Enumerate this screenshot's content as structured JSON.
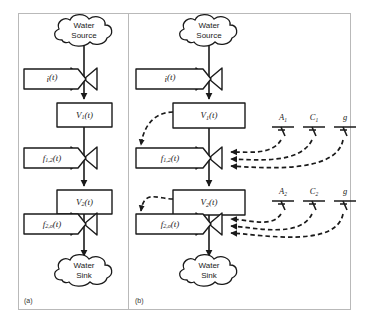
{
  "figure": {
    "panels": [
      {
        "id": "a",
        "label": "(a)",
        "source_cloud": {
          "line1": "Water",
          "line2": "Source"
        },
        "sink_cloud": {
          "line1": "Water",
          "line2": "Sink"
        },
        "flow_inflow": {
          "base": "i",
          "sub": "",
          "arg": "(t)"
        },
        "stock_1": {
          "base": "V",
          "sub": "1",
          "arg": "(t)"
        },
        "flow_mid": {
          "base": "f",
          "sub": "1,2",
          "arg": "(t)"
        },
        "stock_2": {
          "base": "V",
          "sub": "2",
          "arg": "(t)"
        },
        "flow_out": {
          "base": "f",
          "sub": "2,o",
          "arg": "(t)"
        },
        "parameters": []
      },
      {
        "id": "b",
        "label": "(b)",
        "source_cloud": {
          "line1": "Water",
          "line2": "Source"
        },
        "sink_cloud": {
          "line1": "Water",
          "line2": "Sink"
        },
        "flow_inflow": {
          "base": "i",
          "sub": "",
          "arg": "(t)"
        },
        "stock_1": {
          "base": "V",
          "sub": "1",
          "arg": "(t)"
        },
        "flow_mid": {
          "base": "f",
          "sub": "1,2",
          "arg": "(t)"
        },
        "stock_2": {
          "base": "V",
          "sub": "2",
          "arg": "(t)"
        },
        "flow_out": {
          "base": "f",
          "sub": "2,o",
          "arg": "(t)"
        },
        "parameters": [
          {
            "base": "A",
            "sub": "1"
          },
          {
            "base": "C",
            "sub": "1"
          },
          {
            "base": "g",
            "sub": ""
          },
          {
            "base": "A",
            "sub": "2"
          },
          {
            "base": "C",
            "sub": "2"
          },
          {
            "base": "g",
            "sub": ""
          }
        ]
      }
    ],
    "colors": {
      "ink": "#1a1a1a",
      "frame": "#b9b9b9",
      "background": "#ffffff"
    }
  }
}
